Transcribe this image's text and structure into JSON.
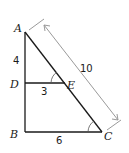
{
  "diagram": {
    "type": "similar-triangles",
    "points": {
      "A": {
        "label": "A",
        "x": 25,
        "y": 32
      },
      "B": {
        "label": "B",
        "x": 25,
        "y": 132
      },
      "C": {
        "label": "C",
        "x": 102,
        "y": 132
      },
      "D": {
        "label": "D",
        "x": 25,
        "y": 83
      },
      "E": {
        "label": "E",
        "x": 65,
        "y": 83
      }
    },
    "lengths": {
      "AD": "4",
      "DE": "3",
      "BC": "6",
      "AC": "10"
    },
    "colors": {
      "line": "#1a1a1a",
      "dimension": "#9a9a9a"
    }
  }
}
